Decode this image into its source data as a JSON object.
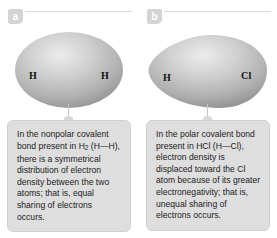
{
  "figure": {
    "background_color": "#ffffff",
    "width": 277,
    "height": 238
  },
  "colors": {
    "badge_background": "#d4d4d4",
    "badge_text": "#ffffff",
    "rule": "#dcdcdc",
    "caption_background": "#dedede",
    "caption_border": "#d0d0d0",
    "caption_text": "#1c1c1c",
    "molecule_light": "#e8e8e8",
    "molecule_mid": "#b4b4b4",
    "molecule_dark": "#8f8f8f",
    "connector": "#c8c8c8",
    "atom_label": "#111111"
  },
  "panels": [
    {
      "badge": "a",
      "molecule": {
        "name": "hydrogen-molecule",
        "formula": "H2",
        "shape": "symmetrical-ellipse",
        "atoms": [
          {
            "symbol": "H",
            "position": "left"
          },
          {
            "symbol": "H",
            "position": "right"
          }
        ]
      },
      "caption": {
        "segments": [
          {
            "text": "In the nonpolar covalent bond present in H"
          },
          {
            "text": "2",
            "subscript": true
          },
          {
            "text": " (H—H), there is a symmetrical distribution of electron density between the two atoms; that is, equal sharing of electrons occurs."
          }
        ]
      }
    },
    {
      "badge": "b",
      "molecule": {
        "name": "hydrogen-chloride-molecule",
        "formula": "HCl",
        "shape": "asymmetrical-egg",
        "atoms": [
          {
            "symbol": "H",
            "position": "left"
          },
          {
            "symbol": "Cl",
            "position": "right"
          }
        ]
      },
      "caption": {
        "segments": [
          {
            "text": "In the polar covalent bond present in HCl (H—Cl), electron density is displaced toward the Cl atom because of its greater electronegativity; that is, unequal sharing of electrons occurs."
          }
        ]
      }
    }
  ]
}
